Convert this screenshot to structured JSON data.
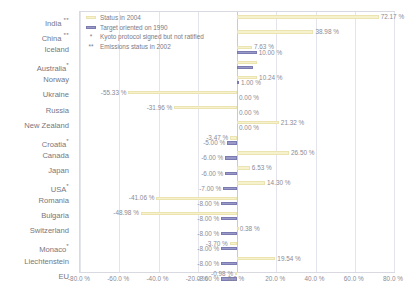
{
  "legend": {
    "items": [
      {
        "marker": "status-swatch",
        "label": "Status in 2004"
      },
      {
        "marker": "target-swatch",
        "label": "Target oriented on 1990"
      },
      {
        "marker": "single-star",
        "symbol": "*",
        "label": "Kyoto protocol signed but not ratified"
      },
      {
        "marker": "double-star",
        "symbol": "**",
        "label": "Emissions status in 2002"
      }
    ]
  },
  "colors": {
    "status_fill": "#f6f2cd",
    "status_stroke": "#ebe4b0",
    "target_fill": "#9a9ac8",
    "target_stroke": "#7b7bb2",
    "grid": "#e4e4ec",
    "axis": "#d9d9e2",
    "text": "#8b8b96"
  },
  "chart_data": {
    "type": "bar",
    "title": "",
    "xlabel": "",
    "ylabel": "",
    "orientation": "horizontal",
    "xlim": [
      -80,
      80
    ],
    "xticks": [
      -80,
      -60,
      -40,
      -20,
      0,
      20,
      40,
      60,
      80
    ],
    "xtick_labels": [
      "-80.0 %",
      "-60.0 %",
      "-40.0 %",
      "-20.0 %",
      "0.0 %",
      "20.0 %",
      "40.0 %",
      "60.0 %",
      "80.0 %"
    ],
    "grid": true,
    "legend_position": "top-left-inside",
    "categories": [
      "India **",
      "China **",
      "Iceland",
      "Australia*",
      "Norway",
      "Ukraine",
      "Russia",
      "New Zealand",
      "Croatia*",
      "Canada",
      "Japan",
      "USA*",
      "Romania",
      "Bulgaria",
      "Switzerland",
      "Monaco*",
      "Liechtenstein",
      "EU"
    ],
    "series": [
      {
        "name": "Status in 2004",
        "values": [
          72.17,
          38.98,
          7.63,
          10.0,
          10.24,
          -55.33,
          -31.96,
          21.32,
          -3.47,
          26.5,
          6.53,
          14.3,
          -41.06,
          -48.98,
          0.38,
          -3.7,
          19.54,
          -0.98
        ],
        "labels": [
          "72.17 %",
          "38.98 %",
          "7.63 %",
          "",
          "10.24 %",
          "-55.33 %",
          "-31.96 %",
          "21.32 %",
          "-3.47 %",
          "26.50 %",
          "6.53 %",
          "14.30 %",
          "-41.06 %",
          "-48.98 %",
          "0.38 %",
          "-3.70 %",
          "19.54 %",
          "-0.98 %"
        ]
      },
      {
        "name": "Target oriented on 1990",
        "values": [
          0,
          0,
          10.0,
          8.0,
          1.0,
          0.0,
          0.0,
          0.0,
          -5.0,
          -6.0,
          -6.0,
          -7.0,
          -8.0,
          -8.0,
          -8.0,
          -8.0,
          -8.0,
          -8.0
        ],
        "labels": [
          "",
          "",
          "10.00 %",
          "",
          "1.00 %",
          "0.00 %",
          "0.00 %",
          "0.00 %",
          "-5.00 %",
          "-6.00 %",
          "-6.00 %",
          "-7.00 %",
          "-8.00 %",
          "-8.00 %",
          "-8.00 %",
          "-8.00 %",
          "-8.00 %",
          "-8.00 %"
        ]
      }
    ]
  }
}
